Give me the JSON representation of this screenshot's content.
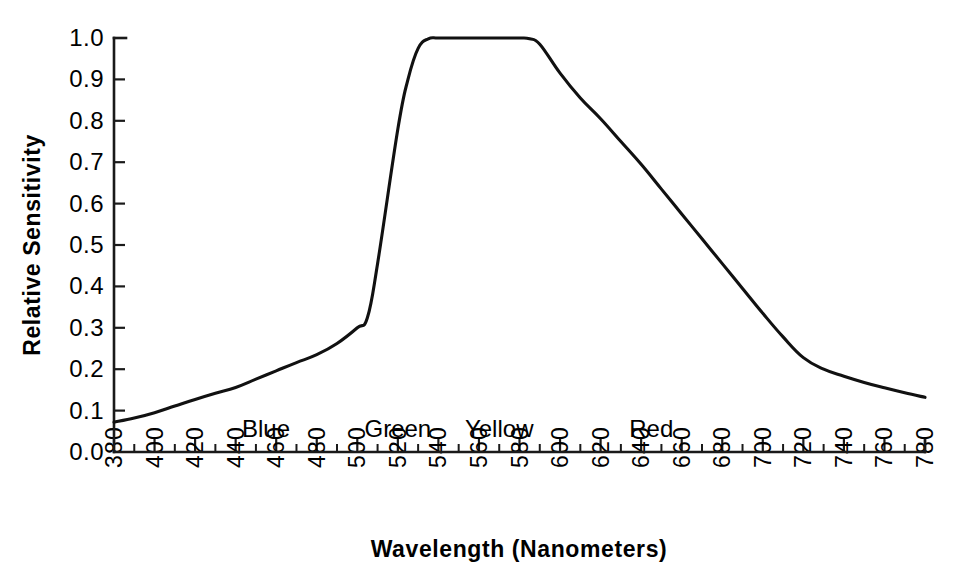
{
  "chart_data": {
    "type": "line",
    "title": "",
    "xlabel": "Wavelength (Nanometers)",
    "ylabel": "Relative Sensitivity",
    "xlim": [
      380,
      780
    ],
    "ylim": [
      0.0,
      1.0
    ],
    "grid": false,
    "legend": "none",
    "x_tick_labels": [
      "380",
      "400",
      "420",
      "440",
      "460",
      "480",
      "500",
      "520",
      "540",
      "560",
      "580",
      "600",
      "620",
      "640",
      "660",
      "680",
      "700",
      "720",
      "740",
      "760",
      "780"
    ],
    "x_tick_values": [
      380,
      400,
      420,
      440,
      460,
      480,
      500,
      520,
      540,
      560,
      580,
      600,
      620,
      640,
      660,
      680,
      700,
      720,
      740,
      760,
      780
    ],
    "x_minor_step": 10,
    "y_tick_labels": [
      "1.0",
      "0.9",
      "0.8",
      "0.7",
      "0.6",
      "0.5",
      "0.4",
      "0.3",
      "0.2",
      "0.1",
      "0.0"
    ],
    "y_tick_values": [
      1.0,
      0.9,
      0.8,
      0.7,
      0.6,
      0.5,
      0.4,
      0.3,
      0.2,
      0.1,
      0.0
    ],
    "series": [
      {
        "name": "Relative Sensitivity",
        "color": "#111111",
        "x": [
          380,
          390,
          400,
          410,
          420,
          430,
          440,
          450,
          460,
          470,
          480,
          490,
          500,
          505,
          510,
          520,
          525,
          530,
          535,
          540,
          550,
          560,
          570,
          580,
          585,
          590,
          600,
          610,
          620,
          630,
          640,
          650,
          660,
          670,
          680,
          690,
          700,
          710,
          720,
          730,
          740,
          750,
          760,
          770,
          780
        ],
        "y": [
          0.072,
          0.082,
          0.095,
          0.111,
          0.127,
          0.142,
          0.156,
          0.176,
          0.196,
          0.216,
          0.235,
          0.262,
          0.3,
          0.325,
          0.455,
          0.78,
          0.9,
          0.975,
          0.998,
          1.0,
          1.0,
          1.0,
          1.0,
          1.0,
          0.998,
          0.985,
          0.915,
          0.855,
          0.805,
          0.75,
          0.695,
          0.635,
          0.575,
          0.515,
          0.455,
          0.395,
          0.335,
          0.278,
          0.228,
          0.2,
          0.183,
          0.168,
          0.155,
          0.143,
          0.132
        ]
      }
    ],
    "band_labels": [
      {
        "text": "Blue",
        "center_nm": 455
      },
      {
        "text": "Green",
        "center_nm": 520
      },
      {
        "text": "Yellow",
        "center_nm": 570
      },
      {
        "text": "Red",
        "center_nm": 645
      }
    ]
  }
}
